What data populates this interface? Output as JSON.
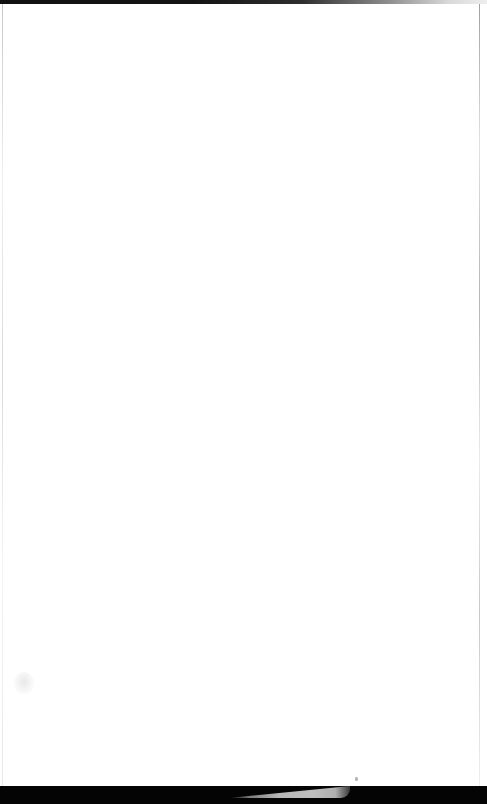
{
  "document": {
    "kind": "scanned-page",
    "content_text": "",
    "note": "blank page, no visible text or graphics"
  },
  "colors": {
    "page_background": "#ffffff",
    "top_edge_strip": "#111111",
    "bottom_band": "#040404",
    "pale_wedge": "#d2d2d2",
    "margin_rule": "#c8c8c8",
    "smudge": "#e4e4e4"
  },
  "regions": {
    "top_edge_strip": {
      "label": "",
      "height_px": 4
    },
    "left_margin_rule": {
      "label": "",
      "x_px": 2
    },
    "right_margin_rule": {
      "label": "",
      "x_px": 479
    },
    "bottom_dark_band": {
      "label": "",
      "y_px": 786,
      "height_px": 18
    },
    "pale_wedge": {
      "label": "",
      "x_px": 228,
      "width_px": 122
    },
    "left_smudge": {
      "label": "",
      "x_px": 14,
      "y_px": 672
    },
    "right_speck": {
      "label": "",
      "x_px": 355,
      "y_px": 777
    }
  }
}
